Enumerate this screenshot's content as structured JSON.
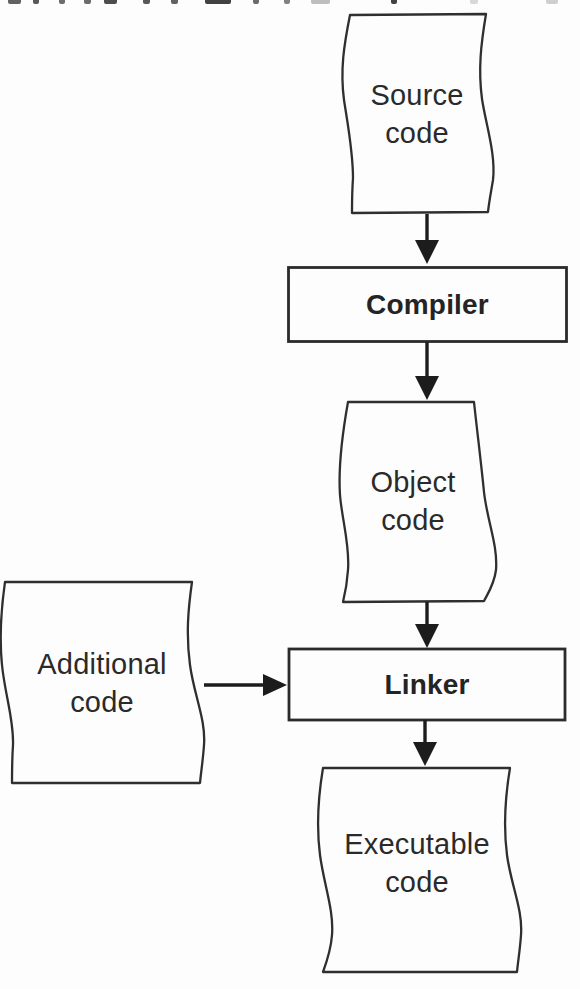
{
  "diagram": {
    "nodes": {
      "source_code": {
        "shape": "document",
        "lines": [
          "Source",
          "code"
        ]
      },
      "compiler": {
        "shape": "process",
        "label": "Compiler"
      },
      "object_code": {
        "shape": "document",
        "lines": [
          "Object",
          "code"
        ]
      },
      "linker": {
        "shape": "process",
        "label": "Linker"
      },
      "additional_code": {
        "shape": "document",
        "lines": [
          "Additional",
          "code"
        ]
      },
      "executable_code": {
        "shape": "document",
        "lines": [
          "Executable",
          "code"
        ]
      }
    },
    "edges": [
      {
        "from": "source_code",
        "to": "compiler"
      },
      {
        "from": "compiler",
        "to": "object_code"
      },
      {
        "from": "object_code",
        "to": "linker"
      },
      {
        "from": "additional_code",
        "to": "linker"
      },
      {
        "from": "linker",
        "to": "executable_code"
      }
    ],
    "colors": {
      "shape_stroke": "#2f2f2f",
      "arrow": "#1c1c1c",
      "text": "#2a2a2a",
      "background": "#fdfdfd"
    }
  }
}
